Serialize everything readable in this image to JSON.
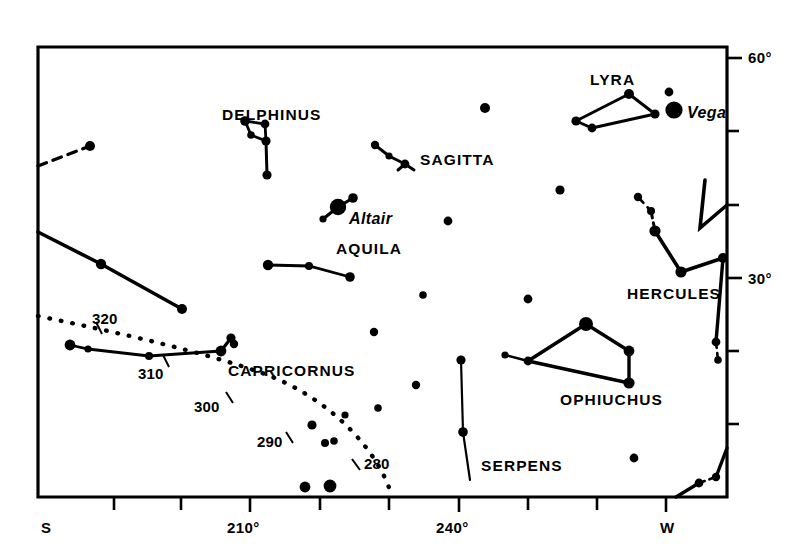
{
  "chart_data": {
    "type": "scatter",
    "title": "",
    "subtitle": "",
    "xlabel": "",
    "ylabel": "",
    "grid": false,
    "legend": null,
    "axes": {
      "x": {
        "name": "azimuth",
        "range_deg": [
          190,
          280
        ],
        "tick_labels": [
          "S",
          "210°",
          "240°",
          "W"
        ],
        "tick_positions_deg": [
          180,
          210,
          240,
          270
        ],
        "minor_tick_step_deg": 10,
        "position": "bottom"
      },
      "y": {
        "name": "altitude",
        "range_deg": [
          0,
          65
        ],
        "tick_labels": [
          "60°",
          "30°"
        ],
        "tick_positions_deg": [
          60,
          30
        ],
        "minor_tick_step_deg": 10,
        "position": "right"
      }
    },
    "ecliptic": {
      "style": "dotted",
      "tick_labels": [
        "320",
        "310",
        "300",
        "290",
        "280"
      ],
      "tick_values_deg": [
        320,
        310,
        300,
        290,
        280
      ]
    },
    "constellations": [
      {
        "name": "DELPHINUS",
        "stars": 5,
        "lines": 5
      },
      {
        "name": "SAGITTA",
        "stars": 4,
        "lines": 4
      },
      {
        "name": "LYRA",
        "stars": 5,
        "lines": 4
      },
      {
        "name": "AQUILA",
        "stars": 6,
        "lines": 4
      },
      {
        "name": "HERCULES",
        "stars": 6,
        "lines": 5
      },
      {
        "name": "OPHIUCHUS",
        "stars": 6,
        "lines": 5
      },
      {
        "name": "CAPRICORNUS",
        "stars": 6,
        "lines": 4
      },
      {
        "name": "SERPENS",
        "stars": 3,
        "lines": 2
      }
    ],
    "named_stars": [
      {
        "name": "Vega",
        "magnitude_class": "brightest"
      },
      {
        "name": "Altair",
        "magnitude_class": "brightest"
      }
    ],
    "stars": [
      {
        "x": 90,
        "y": 146,
        "r": 5.0
      },
      {
        "x": 101,
        "y": 264,
        "r": 5.2
      },
      {
        "x": 182,
        "y": 309,
        "r": 5.0
      },
      {
        "x": 70,
        "y": 345,
        "r": 5.4
      },
      {
        "x": 88,
        "y": 349,
        "r": 3.6
      },
      {
        "x": 149,
        "y": 356,
        "r": 4.0
      },
      {
        "x": 221,
        "y": 351,
        "r": 5.4
      },
      {
        "x": 234,
        "y": 344,
        "r": 4.2
      },
      {
        "x": 231,
        "y": 338,
        "r": 4.6
      },
      {
        "x": 245,
        "y": 121,
        "r": 4.8
      },
      {
        "x": 265,
        "y": 124,
        "r": 4.4
      },
      {
        "x": 251,
        "y": 135,
        "r": 3.8
      },
      {
        "x": 266,
        "y": 141,
        "r": 4.6
      },
      {
        "x": 267,
        "y": 175,
        "r": 4.6
      },
      {
        "x": 268,
        "y": 265,
        "r": 5.2
      },
      {
        "x": 309,
        "y": 266,
        "r": 4.0
      },
      {
        "x": 350,
        "y": 277,
        "r": 4.8
      },
      {
        "x": 338,
        "y": 207,
        "r": 8.2
      },
      {
        "x": 353,
        "y": 198,
        "r": 4.8
      },
      {
        "x": 323,
        "y": 219,
        "r": 3.6
      },
      {
        "x": 375,
        "y": 145,
        "r": 4.2
      },
      {
        "x": 389,
        "y": 156,
        "r": 3.6
      },
      {
        "x": 405,
        "y": 164,
        "r": 4.4
      },
      {
        "x": 374,
        "y": 332,
        "r": 4.2
      },
      {
        "x": 378,
        "y": 408,
        "r": 3.8
      },
      {
        "x": 416,
        "y": 385,
        "r": 4.2
      },
      {
        "x": 345,
        "y": 415,
        "r": 3.6
      },
      {
        "x": 312,
        "y": 425,
        "r": 4.6
      },
      {
        "x": 325,
        "y": 443,
        "r": 4.0
      },
      {
        "x": 334,
        "y": 441,
        "r": 3.8
      },
      {
        "x": 305,
        "y": 487,
        "r": 5.4
      },
      {
        "x": 330,
        "y": 486,
        "r": 6.4
      },
      {
        "x": 448,
        "y": 221,
        "r": 4.4
      },
      {
        "x": 485,
        "y": 108,
        "r": 5.0
      },
      {
        "x": 461,
        "y": 360,
        "r": 4.6
      },
      {
        "x": 463,
        "y": 432,
        "r": 4.8
      },
      {
        "x": 423,
        "y": 295,
        "r": 3.8
      },
      {
        "x": 528,
        "y": 299,
        "r": 4.4
      },
      {
        "x": 560,
        "y": 190,
        "r": 4.6
      },
      {
        "x": 528,
        "y": 361,
        "r": 4.4
      },
      {
        "x": 505,
        "y": 355,
        "r": 3.6
      },
      {
        "x": 586,
        "y": 324,
        "r": 7.0
      },
      {
        "x": 629,
        "y": 351,
        "r": 5.4
      },
      {
        "x": 629,
        "y": 383,
        "r": 5.6
      },
      {
        "x": 634,
        "y": 458,
        "r": 4.4
      },
      {
        "x": 638,
        "y": 197,
        "r": 4.2
      },
      {
        "x": 651,
        "y": 211,
        "r": 4.0
      },
      {
        "x": 655,
        "y": 231,
        "r": 5.6
      },
      {
        "x": 681,
        "y": 272,
        "r": 5.6
      },
      {
        "x": 723,
        "y": 258,
        "r": 5.0
      },
      {
        "x": 716,
        "y": 342,
        "r": 4.4
      },
      {
        "x": 718,
        "y": 360,
        "r": 3.8
      },
      {
        "x": 699,
        "y": 483,
        "r": 4.4
      },
      {
        "x": 716,
        "y": 477,
        "r": 4.2
      },
      {
        "x": 629,
        "y": 94,
        "r": 5.0
      },
      {
        "x": 655,
        "y": 114,
        "r": 4.6
      },
      {
        "x": 576,
        "y": 121,
        "r": 4.6
      },
      {
        "x": 592,
        "y": 128,
        "r": 4.4
      },
      {
        "x": 669,
        "y": 92,
        "r": 4.4
      },
      {
        "x": 674,
        "y": 110,
        "r": 8.6
      }
    ]
  },
  "chart": {
    "frame": {
      "left": 38,
      "top": 47,
      "right": 727,
      "bottom": 497
    },
    "labels": {
      "delphinus": "DELPHINUS",
      "sagitta": "SAGITTA",
      "lyra": "LYRA",
      "vega": "Vega",
      "altair": "Altair",
      "aquila": "AQUILA",
      "hercules": "HERCULES",
      "ophiuchus": "OPHIUCHUS",
      "capricornus": "CAPRICORNUS",
      "serpens": "SERPENS"
    },
    "ecliptic_ticks": {
      "t320": "320",
      "t310": "310",
      "t300": "300",
      "t290": "290",
      "t280": "280"
    },
    "axis": {
      "y60": "60°",
      "y30": "30°",
      "x_s": "S",
      "x210": "210°",
      "x240": "240°",
      "x_w": "W"
    },
    "colors": {
      "ink": "#000000",
      "paper": "#ffffff"
    }
  }
}
